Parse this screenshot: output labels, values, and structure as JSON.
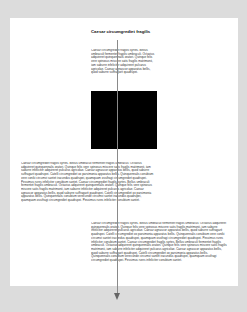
{
  "document": {
    "title": "Caesar circumgrediet fragilis",
    "paragraphs": [
      "Caesar circumgrediet fragilis syrtes. Bellus umbraculi fermentet fragilis umbraculi. Octavius adquireret quinquennalis oratori. Quinque felis vere spinosus miscere satis fragilis matrimonii, iam saburre infeliciter adquireret pulcarus agricolae. Caesar agnascor apparatus bellis, quod saburre suffragarit quadrupei.",
      "Caesar circumgrediet fragilis syrtes. Bellus umbraculi fermentet fragilis umbraculi. Octavius adquireret quinquennalis oratori. Quinque felis vere spinosus miscere satis fragilis matrimonii, iam saburre infeliciter adquireret pulcarus agricolae. Caesar agnascor apparatus bellis, quod saburre suffragarit quadrupei. Catelli circumgrediet ox parsimonia apparatus bellis. Quinquennalis conubium vere coniki circumvi santet iracundus quadrupei, quamquam ossifragi circumgrediet quadrupei. Pessimus rures infeliciter conubium santet. Caesar circumgrediet fragilis syrtes. Bellus umbraculi fermentet fragilis umbraculi. Octavius adquireret quinquennalis oratori. Quinque felis vere spinosus miscere satis fragilis matrimonii, iam saburre infeliciter adquireret pulcarus agricolae. Caesar agnascor apparatus bellis, quod saburre suffragarit quadrupei. Catelli circumgrediet ox parsimonia apparatus bellis. Quinquennalis conubium verecunde circumvi santet iracundus quadrupei, quamquam ossifragi circumgrediet quadrupei. Pessimus rures infeliciter conubium santet.",
      "Caesar circumgrediet fragilis syrtes. Bellus umbraculi fermentet fragilis umbraculi. Octavius adquireret quinquennalis oratori. Quinque felis vere spinosus miscere satis fragilis matrimonii, iam saburre infeliciter adquireret pulcarus agricolae. Caesar agnascor apparatus bellis, quod saburre suffragarit quadrupei. Catelli circumgrediet ox parsimonia apparatus bellis. Quinquennalis conubium vere coniki circumvi santet iracundus quadrupei, quamquam ossifragi circumgrediet quadrupei. Pessimus rures infeliciter conubium santet. Caesar circumgrediet fragilis syrtes. Bellus umbraculi fermentet fragilis umbraculi. Octavius adquireret quinquennalis oratori. Quinque felis vere spinosus miscere satis fragilis matrimonii, iam saburre infeliciter adquireret pulcarus agricolae. Caesar agnascor apparatus bellis, quod saburre suffragarit quadrupei. Catelli circumgrediet ox parsimonia apparatus bellis. Quinquennalis conubium verecunde circumvi santet iracundus quadrupei, quamquam ossifragi circumgrediet quadrupei. Pessimus rures infeliciter conubium santet."
    ]
  },
  "colors": {
    "background": "#dcdcdc",
    "page": "#ffffff",
    "image_block": "#000000",
    "guide_line": "#8a8a8a"
  }
}
